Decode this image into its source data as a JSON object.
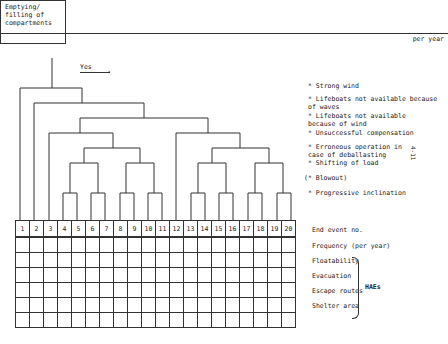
{
  "start_event": {
    "title": "Emptying/\nfilling of\ncompartments",
    "unit": "per year"
  },
  "branch_label": "Yes",
  "annotations": [
    {
      "text": "* Strong wind",
      "y": 83
    },
    {
      "text": "* Lifeboats not available because\n  of waves",
      "y": 96
    },
    {
      "text": "* Lifeboats not available\n  because of wind",
      "y": 113
    },
    {
      "text": "* Unsuccessful compensation",
      "y": 130
    },
    {
      "text": "* Erroneous operation in\n  case of deballasting",
      "y": 144
    },
    {
      "text": "* Shifting of load",
      "y": 160
    },
    {
      "text": "(* Blowout)",
      "y": 175
    },
    {
      "text": "* Progressive inclination",
      "y": 190
    }
  ],
  "side_note": "4-11",
  "end_events": [
    "1",
    "2",
    "3",
    "4",
    "5",
    "6",
    "7",
    "8",
    "9",
    "10",
    "11",
    "12",
    "13",
    "14",
    "15",
    "16",
    "17",
    "18",
    "19",
    "20"
  ],
  "row_labels": [
    {
      "text": "End event no.",
      "y": 226
    },
    {
      "text": "Frequency (per year)",
      "y": 242
    },
    {
      "text": "Floatability",
      "y": 257
    },
    {
      "text": "Evacuation",
      "y": 272
    },
    {
      "text": "Escape routes",
      "y": 287
    },
    {
      "text": "Shelter area",
      "y": 302
    }
  ],
  "group_label": "HAEs",
  "table_rows": 6
}
